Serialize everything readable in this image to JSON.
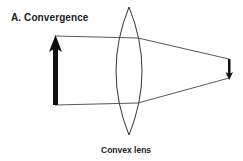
{
  "title": "A. Convergence",
  "lens": {
    "label": "Convex lens",
    "type": "convex",
    "center_x": 129,
    "top_y": 7,
    "bottom_y": 135,
    "half_width": 17
  },
  "object_arrow": {
    "direction": "up",
    "x": 55,
    "tail_y": 105,
    "tip_y": 36
  },
  "image_arrow": {
    "direction": "down",
    "x": 229,
    "tail_y": 59,
    "tip_y": 79
  },
  "rays": [
    {
      "name": "top-ray",
      "points": [
        [
          55,
          36
        ],
        [
          138,
          38
        ],
        [
          229,
          59
        ]
      ]
    },
    {
      "name": "bottom-ray",
      "points": [
        [
          55,
          105
        ],
        [
          138,
          103
        ],
        [
          229,
          78
        ]
      ]
    }
  ],
  "colors": {
    "line": "#333333",
    "arrow": "#111111",
    "text": "#222222",
    "background": "#ffffff"
  }
}
